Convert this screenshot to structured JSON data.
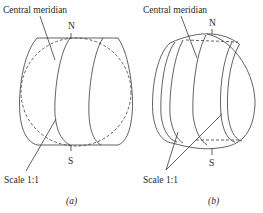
{
  "figure": {
    "panels": [
      {
        "id": "a",
        "caption": "(a)",
        "labels": {
          "central_meridian": "Central meridian",
          "north": "N",
          "south": "S",
          "scale": "Scale 1:1"
        }
      },
      {
        "id": "b",
        "caption": "(b)",
        "labels": {
          "central_meridian": "Central meridian",
          "north": "N",
          "south": "S",
          "scale": "Scale 1:1"
        }
      }
    ],
    "colors": {
      "line": "#3a3a3a",
      "text": "#2a2a2a",
      "background": "#ffffff"
    }
  }
}
